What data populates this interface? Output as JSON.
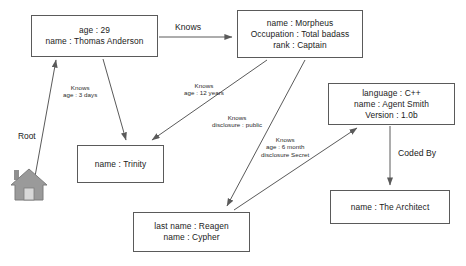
{
  "diagram": {
    "background": "#ffffff",
    "line_color": "#5a5a5a",
    "icon_color": "#8c8c8c"
  },
  "root": {
    "label": "Root",
    "icon": "house-icon"
  },
  "nodes": [
    {
      "id": "thomas",
      "name": "thomas-anderson",
      "lines": [
        "age : 29",
        "name : Thomas Anderson"
      ],
      "x": 31,
      "y": 15,
      "w": 127,
      "h": 42
    },
    {
      "id": "morpheus",
      "name": "morpheus",
      "lines": [
        "name : Morpheus",
        "Occupation : Total badass",
        "rank : Captain"
      ],
      "x": 237,
      "y": 10,
      "w": 126,
      "h": 48
    },
    {
      "id": "agentsmith",
      "name": "agent-smith",
      "lines": [
        "language : C++",
        "name : Agent Smith",
        "Version : 1.0b"
      ],
      "x": 328,
      "y": 83,
      "w": 127,
      "h": 42
    },
    {
      "id": "trinity",
      "name": "trinity",
      "lines": [
        "name : Trinity"
      ],
      "x": 77,
      "y": 145,
      "w": 87,
      "h": 38
    },
    {
      "id": "cypher",
      "name": "cypher",
      "lines": [
        "last name : Reagen",
        "name : Cypher"
      ],
      "x": 133,
      "y": 212,
      "w": 117,
      "h": 40
    },
    {
      "id": "architect",
      "name": "the-architect",
      "lines": [
        "name : The Architect"
      ],
      "x": 330,
      "y": 190,
      "w": 120,
      "h": 34
    }
  ],
  "edges": [
    {
      "id": "root-thomas",
      "name": "edge-root-to-thomas",
      "from": "root",
      "to": "thomas",
      "label_lines": [],
      "path": "M 34 182 L 56 60"
    },
    {
      "id": "thomas-morpheus",
      "name": "edge-thomas-to-morpheus",
      "from": "thomas",
      "to": "morpheus",
      "label_lines": [
        "Knows"
      ],
      "label_x": 175,
      "label_y": 22,
      "label_size": "big",
      "path": "M 159 37 L 232 37"
    },
    {
      "id": "thomas-trinity",
      "name": "edge-thomas-to-trinity",
      "from": "thomas",
      "to": "trinity",
      "label_lines": [
        "Knows",
        "age : 3 days"
      ],
      "label_x": 63,
      "label_y": 84,
      "label_size": "small",
      "path": "M 103 59 L 126 140"
    },
    {
      "id": "morpheus-trinity",
      "name": "edge-morpheus-to-trinity",
      "from": "morpheus",
      "to": "trinity",
      "label_lines": [
        "Knows",
        "age : 12 years"
      ],
      "label_x": 184,
      "label_y": 82,
      "label_size": "small",
      "path": "M 267 60 L 152 140"
    },
    {
      "id": "morpheus-cypher",
      "name": "edge-morpheus-to-cypher",
      "from": "morpheus",
      "to": "cypher",
      "label_lines": [
        "Knows",
        "disclosure  :  public"
      ],
      "label_x": 212,
      "label_y": 114,
      "label_size": "small",
      "path": "M 305 60 L 227 206"
    },
    {
      "id": "cypher-agentsmith",
      "name": "edge-cypher-to-agent-smith",
      "from": "cypher",
      "to": "agentsmith",
      "label_lines": [
        "Knows",
        "age : 6 month",
        "disclosure Secret"
      ],
      "label_x": 261,
      "label_y": 136,
      "label_size": "small",
      "path": "M 234 210 L 357 128"
    },
    {
      "id": "agentsmith-architect",
      "name": "edge-agent-smith-to-architect",
      "from": "agentsmith",
      "to": "architect",
      "label_lines": [
        "Coded By"
      ],
      "label_x": 398,
      "label_y": 148,
      "label_size": "big",
      "path": "M 390 126 L 390 185"
    }
  ]
}
